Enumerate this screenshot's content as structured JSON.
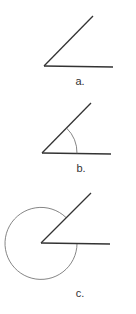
{
  "figures": [
    {
      "id": "a",
      "label": "a.",
      "description": "angle formed by two rays, no marking",
      "vertex": [
        44,
        66
      ],
      "ray_upper_end": [
        93,
        16
      ],
      "ray_horizontal_end": [
        113,
        67
      ],
      "label_pos": [
        80,
        84
      ],
      "marking": "none"
    },
    {
      "id": "b",
      "label": "b.",
      "description": "angle with interior arc marking the acute angle",
      "vertex": [
        42,
        153
      ],
      "ray_upper_end": [
        91,
        103
      ],
      "ray_horizontal_end": [
        111,
        154
      ],
      "label_pos": [
        81,
        171
      ],
      "marking": "interior-arc",
      "arc_radius": 35
    },
    {
      "id": "c",
      "label": "c.",
      "description": "angle with exterior (reflex) arc marking",
      "vertex": [
        41,
        243
      ],
      "ray_upper_end": [
        91,
        193
      ],
      "ray_horizontal_end": [
        110,
        244
      ],
      "label_pos": [
        80,
        296
      ],
      "marking": "reflex-arc",
      "arc_radius": 36
    }
  ],
  "colors": {
    "ray": "#333333",
    "arc": "#666666",
    "label": "#333333",
    "background": "#ffffff"
  }
}
